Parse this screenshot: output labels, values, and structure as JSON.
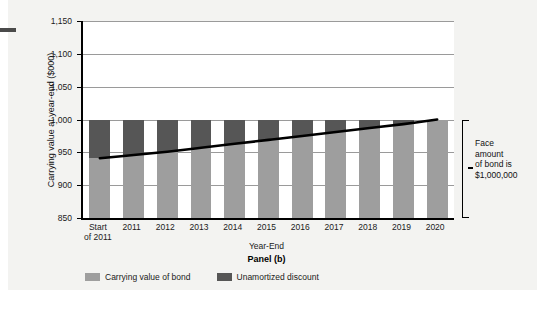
{
  "figure": {
    "panel_title": "Panel (b)",
    "annotation_line1": "Face",
    "annotation_line2": "amount",
    "annotation_line3": "of bond is",
    "annotation_line4": "$1,000,000",
    "annotation_full": "Face amount of bond is $1,000,000"
  },
  "colors": {
    "carrying_value": "#9e9e9e",
    "unamortized_discount": "#565656",
    "curve": "#000000",
    "grid": "#9a9a9a",
    "panel_background": "#f3f3f1"
  },
  "chart_data": {
    "type": "bar",
    "stacked": true,
    "title": "Panel (b)",
    "xlabel": "Year-End",
    "ylabel": "Carrying value at year-end ($000)",
    "ylim": [
      850,
      1150
    ],
    "ytick_values": [
      850,
      900,
      950,
      1000,
      1050,
      1100,
      1150
    ],
    "ytick_labels": [
      "850",
      "900",
      "950",
      "1,000",
      "1,050",
      "1,100",
      "1,150"
    ],
    "grid": true,
    "legend_position": "bottom",
    "categories": [
      "Start of 2011",
      "2011",
      "2012",
      "2013",
      "2014",
      "2015",
      "2016",
      "2017",
      "2018",
      "2019",
      "2020"
    ],
    "category_labels_multiline": [
      [
        "Start",
        "of 2011"
      ],
      [
        "2011"
      ],
      [
        "2012"
      ],
      [
        "2013"
      ],
      [
        "2014"
      ],
      [
        "2015"
      ],
      [
        "2016"
      ],
      [
        "2017"
      ],
      [
        "2018"
      ],
      [
        "2019"
      ],
      [
        "2020"
      ]
    ],
    "series": [
      {
        "name": "Carrying value of bond",
        "color": "#9e9e9e",
        "values": [
          941,
          946,
          951,
          957,
          963,
          969,
          975,
          981,
          987,
          993,
          1000
        ]
      },
      {
        "name": "Unamortized discount",
        "color": "#565656",
        "values": [
          59,
          54,
          49,
          43,
          37,
          31,
          25,
          19,
          13,
          7,
          0
        ]
      }
    ],
    "annotations": [
      {
        "text": "Face amount of bond is $1,000,000",
        "target_value": 1000,
        "position": "right"
      }
    ],
    "overlay_line": {
      "name": "Carrying value of bond",
      "color": "#000000",
      "values": [
        941,
        946,
        951,
        957,
        963,
        969,
        975,
        981,
        987,
        993,
        1000
      ]
    }
  }
}
